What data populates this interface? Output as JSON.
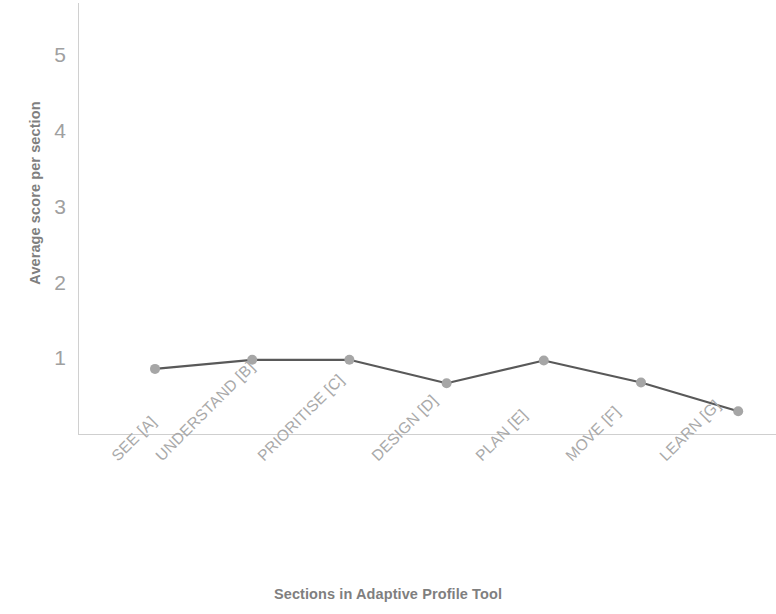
{
  "chart_data": {
    "type": "line",
    "title": "",
    "xlabel": "Sections in Adaptive Profile Tool",
    "ylabel": "Average score per section",
    "categories": [
      "SEE [A]",
      "UNDERSTAND [B]",
      "PRIORITISE [C]",
      "DESIGN [D]",
      "PLAN [E]",
      "MOVE [F]",
      "LEARN [G]"
    ],
    "values": [
      0.86,
      0.98,
      0.98,
      0.67,
      0.97,
      0.68,
      0.3
    ],
    "series": [
      {
        "name": "Average score per section",
        "values": [
          0.86,
          0.98,
          0.98,
          0.67,
          0.97,
          0.68,
          0.3
        ]
      }
    ],
    "ytick_labels": [
      "1",
      "2",
      "3",
      "4",
      "5"
    ],
    "ytick_values": [
      1,
      2,
      3,
      4,
      5
    ],
    "ylim": [
      0,
      5.7
    ],
    "xlim_categories": 7,
    "grid": false,
    "legend": "none",
    "line_color": "#595959",
    "marker_color": "#a6a6a6",
    "axis_color": "#d0d0d0",
    "text_color": "#7f7f7f",
    "tick_text_color": "#a9a9a9"
  }
}
